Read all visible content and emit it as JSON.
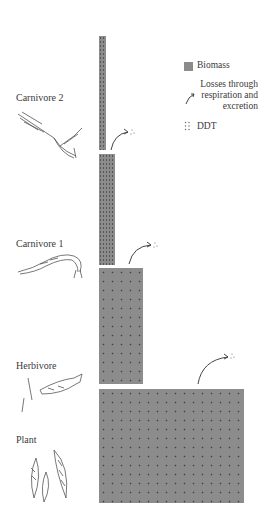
{
  "legend": {
    "biomass": "Biomass",
    "losses_line1": "Losses through",
    "losses_line2": "respiration and",
    "losses_line3": "excretion",
    "ddt": "DDT"
  },
  "levels": [
    {
      "label": "Carnivore 2",
      "organism": "bird-icon"
    },
    {
      "label": "Carnivore 1",
      "organism": "fish-icon"
    },
    {
      "label": "Herbivore",
      "organism": "small-fish-icon"
    },
    {
      "label": "Plant",
      "organism": "plant-icon"
    }
  ],
  "colors": {
    "bar": "#8c8c8c",
    "dots": "#2a2a2a",
    "arrow": "#444444"
  }
}
